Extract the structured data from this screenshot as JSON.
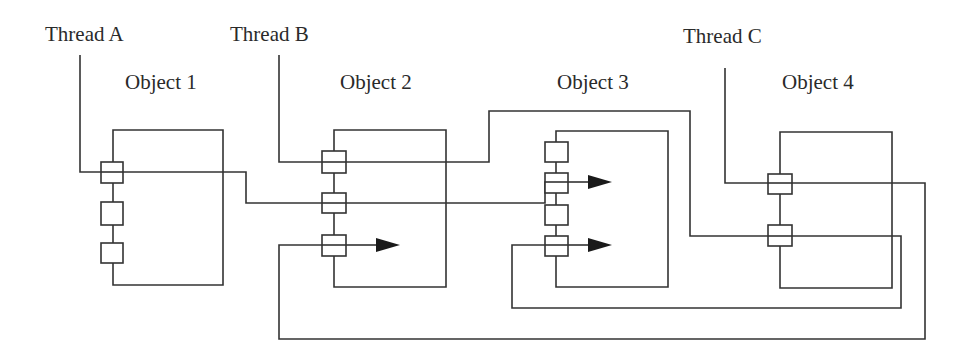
{
  "threads": [
    {
      "id": "A",
      "label": "Thread A"
    },
    {
      "id": "B",
      "label": "Thread B"
    },
    {
      "id": "C",
      "label": "Thread C"
    }
  ],
  "objects": [
    {
      "id": "1",
      "label": "Object 1",
      "entry_points": 3
    },
    {
      "id": "2",
      "label": "Object 2",
      "entry_points": 3
    },
    {
      "id": "3",
      "label": "Object 3",
      "entry_points": 4
    },
    {
      "id": "4",
      "label": "Object 4",
      "entry_points": 2
    }
  ],
  "colors": {
    "line": "#333333",
    "arrow": "#1a1a1a",
    "background": "#ffffff"
  }
}
